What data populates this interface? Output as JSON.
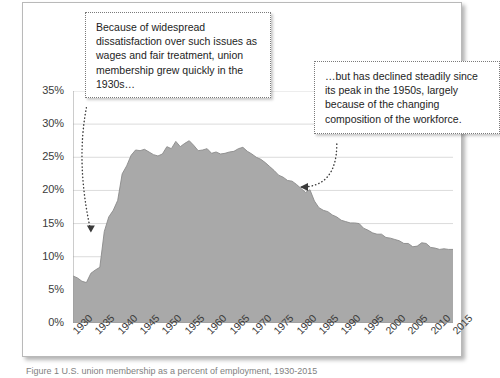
{
  "figure": {
    "background": "#ffffff",
    "frame_border": "#b9b9b9"
  },
  "annotations": {
    "left_box": {
      "text": "Because of widespread dissatisfaction over such issues as wages and fair treatment, union membership grew quickly in the 1930s…",
      "border_style": "dotted"
    },
    "right_box": {
      "text": "…but has declined steadily since its peak in the 1950s, largely because of the changing composition of the workforce.",
      "border_style": "dotted"
    }
  },
  "caption": {
    "text": "Figure 1 U.S. union membership as a percent of employment, 1930-2015"
  },
  "chart_data": {
    "type": "area",
    "title": "",
    "xlabel": "",
    "ylabel": "",
    "xlim": [
      1930,
      2015
    ],
    "ylim": [
      0,
      35
    ],
    "grid": true,
    "legend": false,
    "legend_position": "none",
    "series_color": "#a9a9a9",
    "series_line_color": "#8a8a8a",
    "ytick_labels": [
      "0%",
      "5%",
      "10%",
      "15%",
      "20%",
      "25%",
      "30%",
      "35%"
    ],
    "ytick_values": [
      0,
      5,
      10,
      15,
      20,
      25,
      30,
      35
    ],
    "xtick_labels": [
      "1930",
      "1935",
      "1940",
      "1945",
      "1950",
      "1955",
      "1960",
      "1965",
      "1970",
      "1975",
      "1980",
      "1985",
      "1990",
      "1995",
      "2000",
      "2005",
      "2010",
      "2015"
    ],
    "xtick_values": [
      1930,
      1935,
      1940,
      1945,
      1950,
      1955,
      1960,
      1965,
      1970,
      1975,
      1980,
      1985,
      1990,
      1995,
      2000,
      2005,
      2010,
      2015
    ],
    "series": [
      {
        "name": "Union membership as percent of employment",
        "x": [
          1930,
          1931,
          1932,
          1933,
          1934,
          1935,
          1936,
          1937,
          1938,
          1939,
          1940,
          1941,
          1942,
          1943,
          1944,
          1945,
          1946,
          1947,
          1948,
          1949,
          1950,
          1951,
          1952,
          1953,
          1954,
          1955,
          1956,
          1957,
          1958,
          1959,
          1960,
          1961,
          1962,
          1963,
          1964,
          1965,
          1966,
          1967,
          1968,
          1969,
          1970,
          1971,
          1972,
          1973,
          1974,
          1975,
          1976,
          1977,
          1978,
          1979,
          1980,
          1981,
          1982,
          1983,
          1984,
          1985,
          1986,
          1987,
          1988,
          1989,
          1990,
          1991,
          1992,
          1993,
          1994,
          1995,
          1996,
          1997,
          1998,
          1999,
          2000,
          2001,
          2002,
          2003,
          2004,
          2005,
          2006,
          2007,
          2008,
          2009,
          2010,
          2011,
          2012,
          2013,
          2014,
          2015
        ],
        "values": [
          7.1,
          6.8,
          6.3,
          6.1,
          7.5,
          8.0,
          8.4,
          13.8,
          16.0,
          17.0,
          18.5,
          22.5,
          23.7,
          25.3,
          26.1,
          26.0,
          26.2,
          25.8,
          25.4,
          25.2,
          25.5,
          26.6,
          26.3,
          27.4,
          26.6,
          27.1,
          27.5,
          26.8,
          26.0,
          26.1,
          26.3,
          25.6,
          25.8,
          25.5,
          25.6,
          25.8,
          25.9,
          26.3,
          26.5,
          25.9,
          25.5,
          25.0,
          24.7,
          24.2,
          23.6,
          23.0,
          22.3,
          22.0,
          21.5,
          21.4,
          20.9,
          20.3,
          19.7,
          20.1,
          18.4,
          17.4,
          17.0,
          16.8,
          16.3,
          16.0,
          15.5,
          15.3,
          15.1,
          15.1,
          15.0,
          14.3,
          14.0,
          13.6,
          13.4,
          13.4,
          12.9,
          12.8,
          12.6,
          12.4,
          12.0,
          12.0,
          11.5,
          11.6,
          12.1,
          12.0,
          11.4,
          11.3,
          11.1,
          11.2,
          11.1,
          11.1
        ]
      }
    ],
    "annotation_arrows": [
      {
        "name": "left-arrow",
        "from": [
          1933,
          32.5
        ],
        "to": [
          1934,
          13.8
        ],
        "style": "dotted-curved"
      },
      {
        "name": "right-arrow",
        "from": [
          1989,
          27.0
        ],
        "to": [
          1981,
          20.5
        ],
        "style": "dotted-curved"
      }
    ]
  }
}
